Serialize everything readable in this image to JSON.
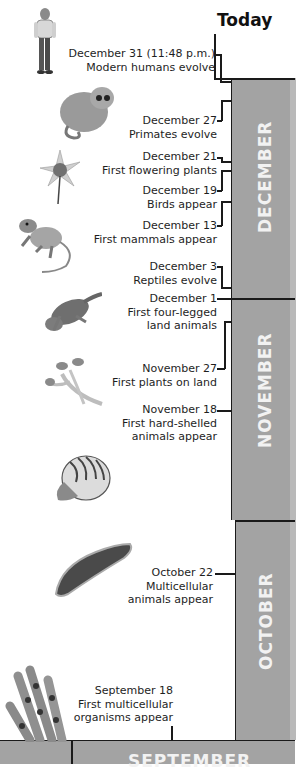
{
  "header": {
    "today_label": "Today"
  },
  "months": [
    {
      "name": "DECEMBER"
    },
    {
      "name": "NOVEMBER"
    },
    {
      "name": "OCTOBER"
    },
    {
      "name": "SEPTEMBER"
    }
  ],
  "events": [
    {
      "date": "December 31 (11:48 p.m.)",
      "description": [
        "Modern humans evolve"
      ],
      "illustration": "human-figure"
    },
    {
      "date": "December 27",
      "description": [
        "Primates evolve"
      ],
      "illustration": "primate"
    },
    {
      "date": "December 21",
      "description": [
        "First flowering plants"
      ],
      "illustration": "flower"
    },
    {
      "date": "December 19",
      "description": [
        "Birds appear"
      ],
      "illustration": ""
    },
    {
      "date": "December 13",
      "description": [
        "First mammals appear"
      ],
      "illustration": "mammal"
    },
    {
      "date": "December 3",
      "description": [
        "Reptiles evolve"
      ],
      "illustration": ""
    },
    {
      "date": "December 1",
      "description": [
        "First four-legged",
        "land animals"
      ],
      "illustration": "amphibian"
    },
    {
      "date": "November 27",
      "description": [
        "First plants on land"
      ],
      "illustration": "land-plant"
    },
    {
      "date": "November 18",
      "description": [
        "First hard-shelled",
        "animals appear"
      ],
      "illustration": "nautilus"
    },
    {
      "date": "October 22",
      "description": [
        "Multicellular",
        "animals appear"
      ],
      "illustration": "flatworm"
    },
    {
      "date": "September 18",
      "description": [
        "First multicellular",
        "organisms appear"
      ],
      "illustration": "algae"
    }
  ],
  "colors": {
    "month_bar": "#a3a3a3",
    "month_text": "#f2f2f2",
    "line": "#1a1a1a",
    "background": "#ffffff"
  }
}
